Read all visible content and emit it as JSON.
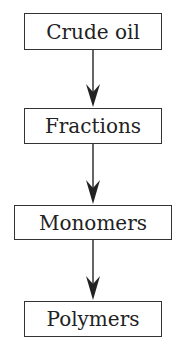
{
  "diagram": {
    "type": "flowchart",
    "direction": "top-to-bottom",
    "nodes": [
      {
        "id": "n1",
        "label": "Crude oil"
      },
      {
        "id": "n2",
        "label": "Fractions"
      },
      {
        "id": "n3",
        "label": "Monomers"
      },
      {
        "id": "n4",
        "label": "Polymers"
      }
    ],
    "edges": [
      {
        "from": "n1",
        "to": "n2"
      },
      {
        "from": "n2",
        "to": "n3"
      },
      {
        "from": "n3",
        "to": "n4"
      }
    ],
    "colors": {
      "stroke": "#333333",
      "text": "#222222",
      "background": "#ffffff"
    }
  }
}
